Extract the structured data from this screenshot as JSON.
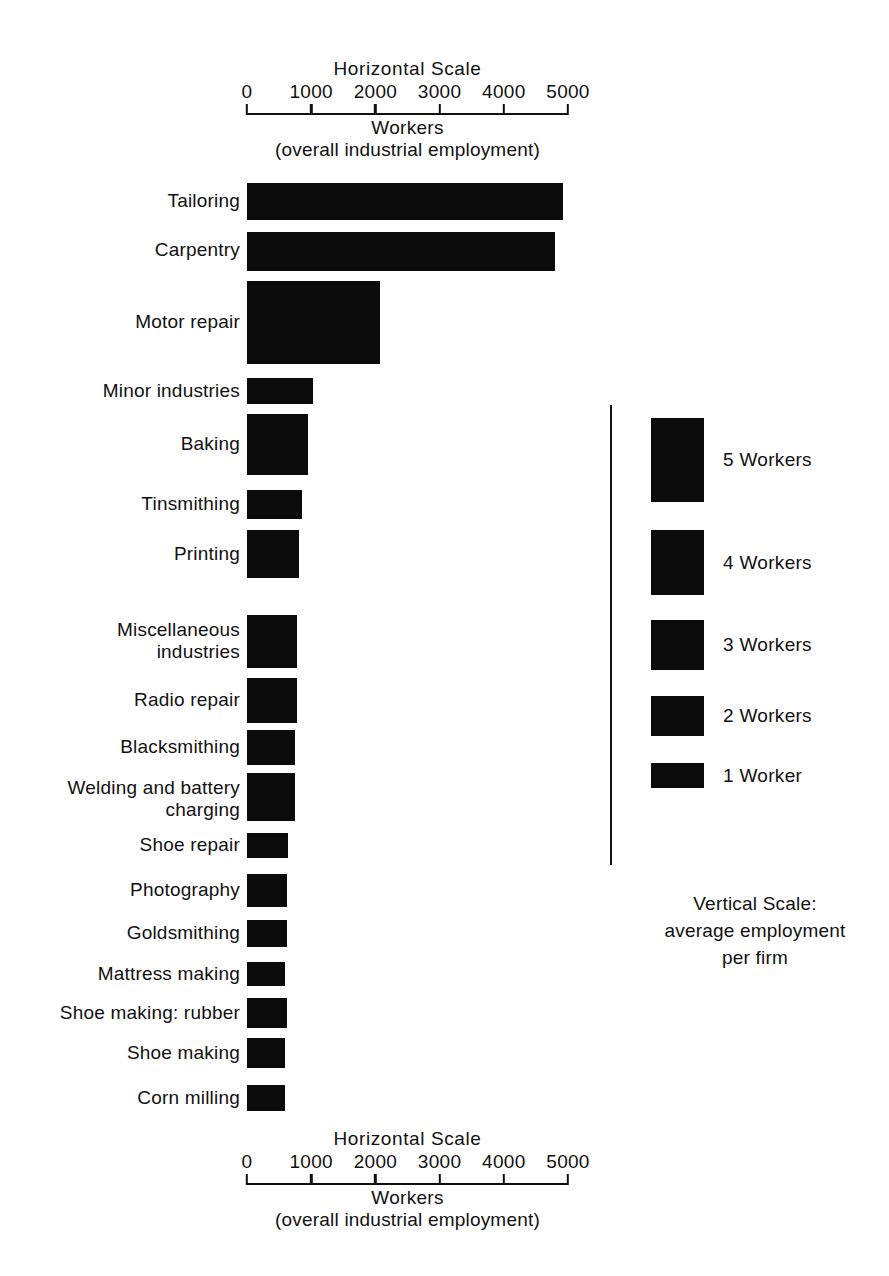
{
  "figure": {
    "top_axis": {
      "title": "Horizontal Scale",
      "unit": "Workers",
      "subtitle": "(overall industrial employment)",
      "ticks": [
        "0",
        "1000",
        "2000",
        "3000",
        "4000",
        "5000"
      ]
    },
    "bottom_axis": {
      "title": "Horizontal  Scale",
      "unit": "Workers",
      "subtitle": "(overall industrial employment)",
      "ticks": [
        "0",
        "1000",
        "2000",
        "3000",
        "4000",
        "5000"
      ]
    },
    "legend": {
      "items": [
        {
          "label": "5 Workers",
          "value": 5
        },
        {
          "label": "4 Workers",
          "value": 4
        },
        {
          "label": "3 Workers",
          "value": 3
        },
        {
          "label": "2 Workers",
          "value": 2
        },
        {
          "label": "1 Worker",
          "value": 1
        }
      ],
      "caption": "Vertical Scale:\naverage employment\nper firm"
    },
    "colors": {
      "bar": "#0b0b0b",
      "axis": "#111111",
      "background": "#ffffff",
      "text": "#111111"
    }
  },
  "chart_data": {
    "type": "bar",
    "orientation": "horizontal",
    "title": "Horizontal Scale",
    "xlabel": "Workers (overall industrial employment)",
    "ylabel": "Vertical Scale: average employment per firm",
    "xlim": [
      0,
      5000
    ],
    "grid": false,
    "legend_position": "right",
    "encoding_note": "Bar length = total workers (horizontal scale); bar thickness = average employment per firm (vertical scale).",
    "categories": [
      "Tailoring",
      "Carpentry",
      "Motor repair",
      "Minor industries",
      "Baking",
      "Tinsmithing",
      "Printing",
      "Miscellaneous industries",
      "Radio repair",
      "Blacksmithing",
      "Welding and battery charging",
      "Shoe repair",
      "Photography",
      "Goldsmithing",
      "Mattress making",
      "Shoe making: rubber",
      "Shoe making",
      "Corn milling"
    ],
    "values": [
      4900,
      4800,
      2050,
      1020,
      950,
      860,
      800,
      760,
      750,
      720,
      720,
      620,
      600,
      600,
      590,
      600,
      590,
      590
    ],
    "thickness_workers_per_firm": [
      2.2,
      2.3,
      5.0,
      1.5,
      3.7,
      1.7,
      2.9,
      3.2,
      2.7,
      2.1,
      2.9,
      1.5,
      2.0,
      1.6,
      1.4,
      1.8,
      1.8,
      1.5
    ],
    "series": [
      {
        "name": "Workers (overall industrial employment)",
        "values": [
          4900,
          4800,
          2050,
          1020,
          950,
          860,
          800,
          760,
          750,
          720,
          720,
          620,
          600,
          600,
          590,
          600,
          590,
          590
        ]
      }
    ],
    "bars": [
      {
        "label": "Tailoring",
        "workers": 4900,
        "avg_per_firm": 2.2
      },
      {
        "label": "Carpentry",
        "workers": 4800,
        "avg_per_firm": 2.3
      },
      {
        "label": "Motor repair",
        "workers": 2050,
        "avg_per_firm": 5.0
      },
      {
        "label": "Minor industries",
        "workers": 1020,
        "avg_per_firm": 1.5
      },
      {
        "label": "Baking",
        "workers": 950,
        "avg_per_firm": 3.7
      },
      {
        "label": "Tinsmithing",
        "workers": 860,
        "avg_per_firm": 1.7
      },
      {
        "label": "Printing",
        "workers": 800,
        "avg_per_firm": 2.9
      },
      {
        "label": "Miscellaneous\nindustries",
        "workers": 760,
        "avg_per_firm": 3.2
      },
      {
        "label": "Radio repair",
        "workers": 750,
        "avg_per_firm": 2.7
      },
      {
        "label": "Blacksmithing",
        "workers": 720,
        "avg_per_firm": 2.1
      },
      {
        "label": "Welding and battery\ncharging",
        "workers": 720,
        "avg_per_firm": 2.9
      },
      {
        "label": "Shoe repair",
        "workers": 620,
        "avg_per_firm": 1.5
      },
      {
        "label": "Photography",
        "workers": 600,
        "avg_per_firm": 2.0
      },
      {
        "label": "Goldsmithing",
        "workers": 600,
        "avg_per_firm": 1.6
      },
      {
        "label": "Mattress making",
        "workers": 590,
        "avg_per_firm": 1.4
      },
      {
        "label": "Shoe making: rubber",
        "workers": 600,
        "avg_per_firm": 1.8
      },
      {
        "label": "Shoe making",
        "workers": 590,
        "avg_per_firm": 1.8
      },
      {
        "label": "Corn milling",
        "workers": 590,
        "avg_per_firm": 1.5
      }
    ]
  },
  "_layout": {
    "bar_geometry": [
      {
        "top": 183,
        "height": 37,
        "right": 563
      },
      {
        "top": 232,
        "height": 39,
        "right": 555
      },
      {
        "top": 281,
        "height": 83,
        "right": 380
      },
      {
        "top": 378,
        "height": 26,
        "right": 313
      },
      {
        "top": 414,
        "height": 61,
        "right": 308
      },
      {
        "top": 490,
        "height": 29,
        "right": 302
      },
      {
        "top": 530,
        "height": 48,
        "right": 299
      },
      {
        "top": 615,
        "height": 53,
        "right": 297
      },
      {
        "top": 678,
        "height": 45,
        "right": 297
      },
      {
        "top": 730,
        "height": 35,
        "right": 295
      },
      {
        "top": 773,
        "height": 48,
        "right": 295
      },
      {
        "top": 833,
        "height": 25,
        "right": 288
      },
      {
        "top": 874,
        "height": 33,
        "right": 287
      },
      {
        "top": 920,
        "height": 27,
        "right": 287
      },
      {
        "top": 962,
        "height": 24,
        "right": 285
      },
      {
        "top": 998,
        "height": 30,
        "right": 287
      },
      {
        "top": 1038,
        "height": 30,
        "right": 285
      },
      {
        "top": 1085,
        "height": 26,
        "right": 285
      }
    ],
    "label_center": [
      201,
      250,
      322,
      391,
      444,
      504,
      554,
      641,
      700,
      747,
      799,
      845,
      890,
      933,
      974,
      1013,
      1053,
      1098
    ],
    "legend_geometry": [
      {
        "top": 418,
        "height": 84
      },
      {
        "top": 530,
        "height": 65
      },
      {
        "top": 620,
        "height": 50
      },
      {
        "top": 696,
        "height": 40
      },
      {
        "top": 763,
        "height": 25
      }
    ]
  }
}
